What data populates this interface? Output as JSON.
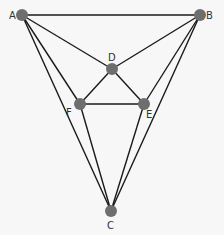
{
  "diagram": {
    "type": "graph",
    "background": "#f7f7f7",
    "edge_color": "#1a1a1a",
    "node_color": "#6e6e6e",
    "label_color": "#333333",
    "nodes": [
      {
        "id": "A",
        "label": "A",
        "x": 22,
        "y": 15,
        "lx": 9,
        "ly": 19
      },
      {
        "id": "B",
        "label": "B",
        "x": 200,
        "y": 15,
        "lx": 206,
        "ly": 19
      },
      {
        "id": "D",
        "label": "D",
        "x": 112,
        "y": 69,
        "lx": 108,
        "ly": 61
      },
      {
        "id": "F",
        "label": "F",
        "x": 80,
        "y": 104,
        "lx": 66,
        "ly": 116
      },
      {
        "id": "E",
        "label": "E",
        "x": 144,
        "y": 104,
        "lx": 146,
        "ly": 118
      },
      {
        "id": "C",
        "label": "C",
        "x": 111,
        "y": 211,
        "lx": 107,
        "ly": 229
      }
    ],
    "edges": [
      [
        "A",
        "B"
      ],
      [
        "A",
        "D"
      ],
      [
        "B",
        "D"
      ],
      [
        "A",
        "F"
      ],
      [
        "A",
        "C"
      ],
      [
        "B",
        "E"
      ],
      [
        "B",
        "C"
      ],
      [
        "D",
        "F"
      ],
      [
        "D",
        "E"
      ],
      [
        "F",
        "E"
      ],
      [
        "F",
        "C"
      ],
      [
        "E",
        "C"
      ]
    ]
  }
}
